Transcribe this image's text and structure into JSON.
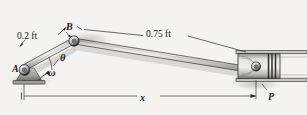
{
  "figure": {
    "type": "slider-crank-mechanism",
    "background_color": "#f4f3f1",
    "ink_color": "#1a1a1a",
    "link_fill": "#b9b9b7",
    "link_edge": "#4a4a48"
  },
  "labels": {
    "crank_length": "0.2 ft",
    "rod_length": "0.75 ft",
    "point_b": "B",
    "point_a": "A",
    "angle_theta": "θ",
    "angular_velocity": "ω",
    "point_p": "P",
    "distance_x": "x"
  },
  "geometry": {
    "pivot_a": {
      "x": 24,
      "y": 70
    },
    "joint_b": {
      "x": 75,
      "y": 42
    },
    "piston_pin": {
      "x": 256,
      "y": 72
    },
    "crank_label_value": "0.2 ft",
    "rod_label_value": "0.75 ft",
    "dimension_line_y": 96,
    "dimension_from_x": 24,
    "dimension_to_x": 256
  },
  "icons": {
    "ground_support": "hatched-ground-support-icon",
    "revolute_joint": "pin-joint-icon",
    "rotation_arrow": "curved-arrow-icon",
    "piston": "piston-icon",
    "cylinder": "cylinder-icon"
  }
}
